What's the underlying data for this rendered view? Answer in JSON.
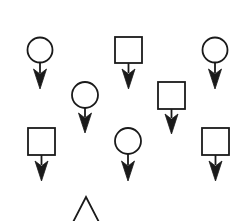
{
  "diagram": {
    "background": "#ffffff",
    "stroke_color": "#1a1a1a",
    "stroke_width": 1.8,
    "symbols": [
      {
        "type": "circle",
        "cx": 40,
        "cy": 50,
        "r": 12.5,
        "arrow_tip": 89
      },
      {
        "type": "square",
        "x": 115,
        "y": 37,
        "w": 27,
        "h": 26,
        "arrow_tip": 89
      },
      {
        "type": "circle",
        "cx": 215,
        "cy": 50,
        "r": 12.5,
        "arrow_tip": 89
      },
      {
        "type": "circle",
        "cx": 85,
        "cy": 95,
        "r": 13,
        "arrow_tip": 133
      },
      {
        "type": "square",
        "x": 158,
        "y": 82,
        "w": 27,
        "h": 27,
        "arrow_tip": 134
      },
      {
        "type": "square",
        "x": 28,
        "y": 128,
        "w": 27,
        "h": 27,
        "arrow_tip": 181
      },
      {
        "type": "circle",
        "cx": 128,
        "cy": 141,
        "r": 13,
        "arrow_tip": 181
      },
      {
        "type": "square",
        "x": 202,
        "y": 128,
        "w": 27,
        "h": 27,
        "arrow_tip": 181
      },
      {
        "type": "triangle",
        "apex_x": 86,
        "apex_y": 197,
        "base_left_x": 70,
        "base_right_x": 102,
        "base_y": 228
      }
    ]
  }
}
